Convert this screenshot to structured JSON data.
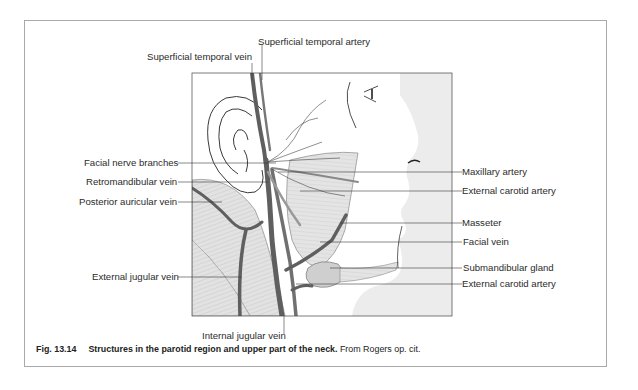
{
  "figure": {
    "labels_left": [
      {
        "id": "superficial-temporal-vein",
        "text": "Superficial temporal vein"
      },
      {
        "id": "facial-nerve-branches",
        "text": "Facial nerve branches"
      },
      {
        "id": "retromandibular-vein",
        "text": "Retromandibular vein"
      },
      {
        "id": "posterior-auricular-vein",
        "text": "Posterior auricular vein"
      },
      {
        "id": "external-jugular-vein",
        "text": "External jugular vein"
      }
    ],
    "labels_top": [
      {
        "id": "superficial-temporal-artery",
        "text": "Superficial temporal artery"
      }
    ],
    "labels_bottom": [
      {
        "id": "internal-jugular-vein",
        "text": "Internal jugular vein"
      }
    ],
    "labels_right": [
      {
        "id": "maxillary-artery",
        "text": "Maxillary artery"
      },
      {
        "id": "external-carotid-artery-upper",
        "text": "External carotid artery"
      },
      {
        "id": "masseter",
        "text": "Masseter"
      },
      {
        "id": "facial-vein",
        "text": "Facial vein"
      },
      {
        "id": "submandibular-gland",
        "text": "Submandibular gland"
      },
      {
        "id": "external-carotid-artery-lower",
        "text": "External carotid artery"
      }
    ],
    "caption": {
      "number": "Fig. 13.14",
      "title": "Structures in the parotid region and upper part of the neck.",
      "source": " From Rogers op. cit."
    },
    "colors": {
      "vessel": "#5f5f5f",
      "muscle_fill": "#dcdcdc",
      "face_shade": "#ececec",
      "frame": "#a9a9a9",
      "leader": "#3a3a3a"
    }
  }
}
